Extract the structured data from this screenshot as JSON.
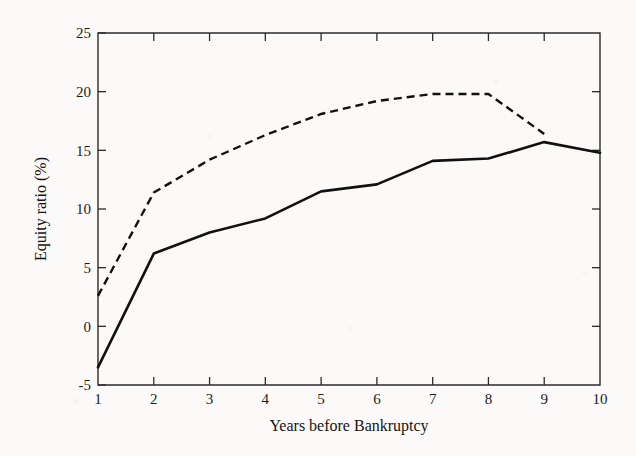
{
  "chart_data": {
    "type": "line",
    "title": "",
    "xlabel": "Years before Bankruptcy",
    "ylabel": "Equity ratio (%)",
    "x": [
      1,
      2,
      3,
      4,
      5,
      6,
      7,
      8,
      9,
      10
    ],
    "xlim": [
      1,
      10
    ],
    "ylim": [
      -5,
      25
    ],
    "xticks": [
      "1",
      "2",
      "3",
      "4",
      "5",
      "6",
      "7",
      "8",
      "9",
      "10"
    ],
    "yticks": [
      "-5",
      "0",
      "5",
      "10",
      "15",
      "20",
      "25"
    ],
    "ytick_values": [
      -5,
      0,
      5,
      10,
      15,
      20,
      25
    ],
    "grid": false,
    "legend": "none",
    "series": [
      {
        "name": "solid-series",
        "style": "solid",
        "color": "#111111",
        "x": [
          1,
          2,
          3,
          4,
          5,
          6,
          7,
          8,
          9,
          10
        ],
        "values": [
          -3.5,
          6.2,
          8.0,
          9.2,
          11.5,
          12.1,
          14.1,
          14.3,
          15.7,
          14.8
        ]
      },
      {
        "name": "dashed-series",
        "style": "dashed",
        "color": "#111111",
        "x": [
          1,
          2,
          3,
          4,
          5,
          6,
          7,
          8,
          9
        ],
        "values": [
          2.6,
          11.4,
          14.2,
          16.3,
          18.1,
          19.2,
          19.8,
          19.8,
          16.4
        ]
      }
    ]
  },
  "figure": {
    "background_color": "#fbfaf8",
    "ink_color": "#111111",
    "axis_color": "#2b2b2b"
  }
}
